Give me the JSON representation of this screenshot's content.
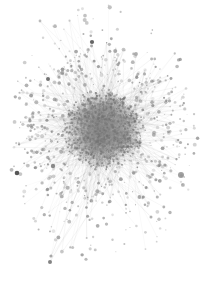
{
  "figure": {
    "type": "node-link-network-graph",
    "title": "",
    "width": 209,
    "height": 295,
    "background_color": "#ffffff",
    "has_axes": false,
    "has_legend": false,
    "has_labels": false,
    "has_border": false,
    "layout": "force-directed",
    "alt_text": "Force-directed network graph with a dense gray hairball core and sparse scattered peripheral nodes on a white background"
  },
  "chart_data": {
    "type": "scatter",
    "title": "",
    "xlabel": "",
    "ylabel": "",
    "grid": false,
    "legend_position": "none",
    "xlim": [
      0,
      209
    ],
    "ylim": [
      0,
      295
    ],
    "core": {
      "center_x": 103,
      "center_y": 130,
      "radius_x": 40,
      "radius_y": 38,
      "peak_gray": "#808080"
    },
    "halo": {
      "center_x": 103,
      "center_y": 135,
      "radius_x": 95,
      "radius_y": 130
    },
    "counts": {
      "core_nodes": 900,
      "mid_nodes": 420,
      "peripheral_nodes": 230,
      "core_edges": 2600,
      "spoke_edges": 620,
      "long_edges": 90,
      "total_nodes_approx": 1550,
      "total_edges_approx": 3310
    },
    "node_style": {
      "color": "#8c8c8c",
      "core_color": "#707070",
      "min_radius": 0.45,
      "max_radius": 2.6,
      "opacity_min": 0.18,
      "opacity_max": 0.85
    },
    "edge_style": {
      "color": "#8a8a8a",
      "width": 0.35,
      "opacity_min": 0.05,
      "opacity_max": 0.3
    },
    "notable_nodes": [
      {
        "x": 17,
        "y": 173,
        "r": 2.3,
        "gray": "#3a3a3a",
        "note": "dark isolated node, far left"
      },
      {
        "x": 181,
        "y": 175,
        "r": 3.0,
        "gray": "#8f8f8f",
        "note": "large soft node, right, long edges to core"
      },
      {
        "x": 92,
        "y": 42,
        "r": 2.1,
        "gray": "#4a4a4a",
        "note": "dark node, upper middle"
      },
      {
        "x": 50,
        "y": 262,
        "r": 2.0,
        "gray": "#6e6e6e",
        "note": "dark node, lower left"
      },
      {
        "x": 48,
        "y": 79,
        "r": 2.0,
        "gray": "#5a5a5a",
        "note": "dark node, upper left"
      },
      {
        "x": 136,
        "y": 54,
        "r": 1.9,
        "gray": "#a0a0a0",
        "note": "ring node, upper right"
      },
      {
        "x": 53,
        "y": 166,
        "r": 2.2,
        "gray": "#777777",
        "note": "node, lower left of core"
      },
      {
        "x": 51,
        "y": 256,
        "r": 1.6,
        "gray": "#9a9a9a",
        "note": "small node, bottom left"
      },
      {
        "x": 151,
        "y": 217,
        "r": 1.5,
        "gray": "#a5a5a5",
        "note": "small node, lower right"
      },
      {
        "x": 40,
        "y": 21,
        "r": 1.4,
        "gray": "#b0b0b0",
        "note": "faint node, top left"
      }
    ],
    "seed": 20240517
  }
}
